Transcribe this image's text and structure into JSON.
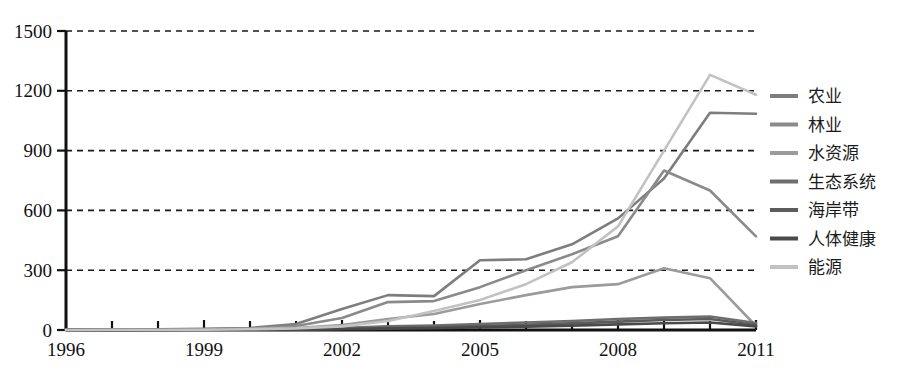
{
  "chart_data": {
    "type": "line",
    "title": "",
    "subtitle": "",
    "xlabel": "",
    "ylabel": "",
    "xlim": [
      1996,
      2011
    ],
    "ylim": [
      0,
      1500
    ],
    "grid": true,
    "grid_style": "dashed horizontal",
    "legend_position": "right",
    "x": [
      1996,
      1997,
      1998,
      1999,
      2000,
      2001,
      2002,
      2003,
      2004,
      2005,
      2006,
      2007,
      2008,
      2009,
      2010,
      2011
    ],
    "y_ticks": [
      0,
      300,
      600,
      900,
      1200,
      1500
    ],
    "y_tick_labels": [
      "0",
      "300",
      "600",
      "900",
      "1200",
      "1500"
    ],
    "x_ticks": [
      1996,
      1999,
      2002,
      2005,
      2008,
      2011
    ],
    "x_tick_labels": [
      "1996",
      "1999",
      "2002",
      "2005",
      "2008",
      "2011"
    ],
    "x_minor_ticks": [
      1997,
      1998,
      2000,
      2001,
      2003,
      2004,
      2006,
      2007,
      2009,
      2010
    ],
    "series": [
      {
        "name": "农业",
        "color": "#7d7d7d",
        "values": [
          2,
          3,
          4,
          6,
          10,
          30,
          105,
          175,
          170,
          350,
          355,
          430,
          560,
          760,
          1090,
          1085
        ]
      },
      {
        "name": "林业",
        "color": "#8a8a8a",
        "values": [
          1,
          2,
          3,
          4,
          8,
          20,
          60,
          140,
          145,
          215,
          300,
          380,
          470,
          800,
          700,
          470
        ]
      },
      {
        "name": "水资源",
        "color": "#9b9b9b",
        "values": [
          1,
          2,
          2,
          3,
          5,
          10,
          25,
          55,
          80,
          130,
          175,
          215,
          230,
          310,
          260,
          20
        ]
      },
      {
        "name": "生态系统",
        "color": "#6e6e6e",
        "values": [
          0,
          1,
          1,
          2,
          3,
          5,
          10,
          18,
          22,
          30,
          38,
          45,
          55,
          62,
          68,
          35
        ]
      },
      {
        "name": "海岸带",
        "color": "#5c5c5c",
        "values": [
          0,
          0,
          1,
          1,
          2,
          3,
          6,
          10,
          14,
          20,
          26,
          33,
          42,
          50,
          55,
          25
        ]
      },
      {
        "name": "人体健康",
        "color": "#4a4a4a",
        "values": [
          0,
          0,
          0,
          1,
          1,
          2,
          4,
          7,
          9,
          13,
          17,
          22,
          28,
          34,
          38,
          18
        ]
      },
      {
        "name": "能源",
        "color": "#c2c2c2",
        "values": [
          0,
          1,
          1,
          2,
          4,
          8,
          18,
          45,
          95,
          150,
          230,
          340,
          520,
          900,
          1280,
          1180
        ]
      }
    ]
  },
  "legend": {
    "entries": [
      {
        "label": "农业"
      },
      {
        "label": "林业"
      },
      {
        "label": "水资源"
      },
      {
        "label": "生态系统"
      },
      {
        "label": "海岸带"
      },
      {
        "label": "人体健康"
      },
      {
        "label": "能源"
      }
    ]
  }
}
